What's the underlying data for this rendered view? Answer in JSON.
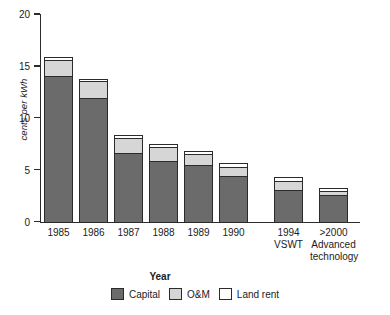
{
  "chart_data": {
    "type": "bar",
    "subtype": "stacked",
    "title": "",
    "xlabel": "Year",
    "ylabel": "cents per kWh",
    "ylim": [
      0,
      20
    ],
    "yticks": [
      0,
      5,
      10,
      15,
      20
    ],
    "ytick_labels": [
      "0",
      "5",
      "10",
      "15",
      "20"
    ],
    "grid": false,
    "legend_position": "bottom",
    "categories": [
      "1985",
      "1986",
      "1987",
      "1988",
      "1989",
      "1990",
      "1994 VSWT",
      ">2000 Advanced technology"
    ],
    "category_labels": [
      {
        "line1": "1985",
        "line2": "",
        "line3": ""
      },
      {
        "line1": "1986",
        "line2": "",
        "line3": ""
      },
      {
        "line1": "1987",
        "line2": "",
        "line3": ""
      },
      {
        "line1": "1988",
        "line2": "",
        "line3": ""
      },
      {
        "line1": "1989",
        "line2": "",
        "line3": ""
      },
      {
        "line1": "1990",
        "line2": "",
        "line3": ""
      },
      {
        "line1": "1994",
        "line2": "VSWT",
        "line3": ""
      },
      {
        "line1": ">2000",
        "line2": "Advanced",
        "line3": "technology"
      }
    ],
    "series": [
      {
        "name": "Capital",
        "color": "#6b6b6b",
        "values": [
          14.0,
          11.9,
          6.6,
          5.8,
          5.5,
          4.4,
          3.0,
          2.6
        ]
      },
      {
        "name": "O&M",
        "color": "#d6d6d6",
        "values": [
          1.7,
          1.8,
          1.6,
          1.5,
          1.1,
          1.0,
          1.0,
          0.5
        ]
      },
      {
        "name": "Land rent",
        "color": "#ffffff",
        "values": [
          0.4,
          0.3,
          0.4,
          0.4,
          0.4,
          0.5,
          0.5,
          0.4
        ]
      }
    ],
    "totals": [
      16.1,
      14.0,
      8.6,
      7.7,
      7.0,
      5.9,
      4.5,
      3.5
    ]
  },
  "legend": {
    "items": [
      {
        "label": "Capital",
        "swatch": "cap"
      },
      {
        "label": "O&M",
        "swatch": "om"
      },
      {
        "label": "Land rent",
        "swatch": "land"
      }
    ]
  },
  "axis": {
    "y_title": "cents per kWh",
    "x_title": "Year"
  },
  "colors": {
    "capital": "#6b6b6b",
    "om": "#d6d6d6",
    "land_rent": "#ffffff",
    "axis": "#2b2b2b",
    "text": "#1b1b1b"
  }
}
